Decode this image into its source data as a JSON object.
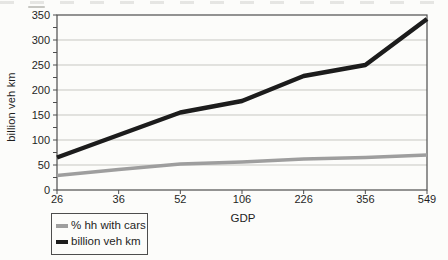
{
  "chart_data": {
    "type": "line",
    "title": "",
    "xlabel": "GDP",
    "ylabel": "billion veh km",
    "categories": [
      "26",
      "36",
      "52",
      "106",
      "226",
      "356",
      "549"
    ],
    "yticks": [
      0,
      50,
      100,
      150,
      200,
      250,
      300,
      350
    ],
    "ylim": [
      0,
      350
    ],
    "ytick_minor_step": 25,
    "grid": true,
    "legend_position": "bottom-left",
    "series": [
      {
        "name": "% hh with cars",
        "color": "#9e9e9e",
        "values": [
          29,
          41,
          52,
          56,
          62,
          65,
          70
        ]
      },
      {
        "name": "billion veh km",
        "color": "#1c1c1c",
        "values": [
          65,
          110,
          155,
          178,
          228,
          250,
          342
        ]
      }
    ],
    "colors": {
      "grid": "#c7c7c2",
      "axis": "#4d4d4d",
      "text": "#1f1f1f",
      "background": "#fcfcfa"
    }
  }
}
